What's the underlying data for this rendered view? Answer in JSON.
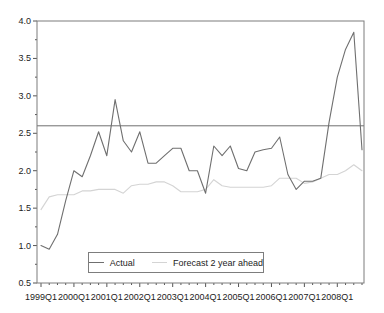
{
  "chart_data": {
    "type": "line",
    "title": "",
    "xlabel": "",
    "ylabel": "",
    "x_start": "1999Q1",
    "x_end": "2008Q4",
    "x_frequency": "quarterly",
    "x_tick_labels": [
      "1999Q1",
      "2000Q1",
      "2001Q1",
      "2002Q1",
      "2003Q1",
      "2004Q1",
      "2005Q1",
      "2006Q1",
      "2007Q1",
      "2008Q1"
    ],
    "x_major_tick_every": 4,
    "y_tick_labels": [
      "0.5",
      "1.0",
      "1.5",
      "2.0",
      "2.5",
      "3.0",
      "3.5",
      "4.0"
    ],
    "ylim": [
      0.5,
      4.0
    ],
    "y_minor_step": 0.25,
    "grid": false,
    "reference_line_y": 2.6,
    "legend_position": "bottom-center-inside",
    "frame_color": "#7d7d7d",
    "tick_color": "#555555",
    "text_color": "#1c1c1c",
    "series": [
      {
        "name": "Actual",
        "color": "#6f6f6f",
        "values": [
          1.0,
          0.95,
          1.15,
          1.6,
          2.0,
          1.92,
          2.2,
          2.52,
          2.2,
          2.95,
          2.4,
          2.25,
          2.52,
          2.1,
          2.1,
          2.2,
          2.3,
          2.3,
          2.0,
          2.0,
          1.7,
          2.33,
          2.2,
          2.33,
          2.03,
          2.0,
          2.25,
          2.28,
          2.3,
          2.45,
          1.95,
          1.75,
          1.86,
          1.86,
          1.9,
          2.65,
          3.25,
          3.62,
          3.85,
          2.28
        ]
      },
      {
        "name": "Forecast 2 year ahead",
        "color": "#d4d4d4",
        "values": [
          1.48,
          1.65,
          1.68,
          1.68,
          1.68,
          1.73,
          1.73,
          1.75,
          1.75,
          1.75,
          1.7,
          1.8,
          1.82,
          1.82,
          1.85,
          1.85,
          1.8,
          1.72,
          1.72,
          1.72,
          1.75,
          1.88,
          1.8,
          1.78,
          1.78,
          1.78,
          1.78,
          1.78,
          1.8,
          1.9,
          1.9,
          1.9,
          1.83,
          1.85,
          1.9,
          1.95,
          1.95,
          2.0,
          2.08,
          2.0
        ]
      }
    ]
  }
}
